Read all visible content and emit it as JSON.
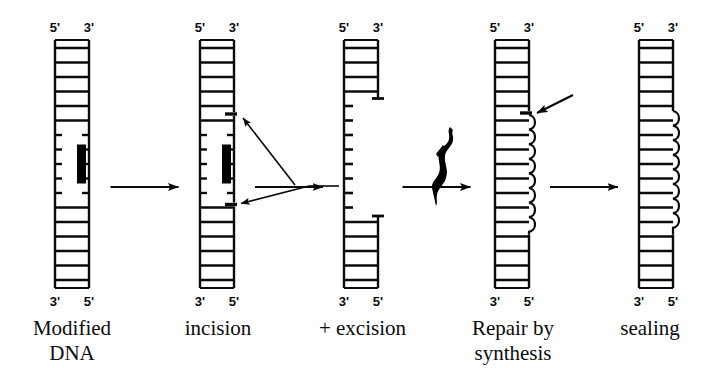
{
  "figure": {
    "ink_color": "#0b0b0b",
    "background": "#ffffff",
    "lesion_color": "#000000"
  },
  "stages": [
    {
      "id": "modified-dna",
      "caption": "Modified\nDNA",
      "caption_lines": [
        "Modified",
        "DNA"
      ],
      "top_left_label": "5'",
      "top_right_label": "3'",
      "bottom_left_label": "3'",
      "bottom_right_label": "5'",
      "center_x": 72,
      "feature": "lesion",
      "feature_note": "black bar lesion with broken rungs"
    },
    {
      "id": "incision",
      "caption": "incision",
      "caption_lines": [
        "incision"
      ],
      "top_left_label": "5'",
      "top_right_label": "3'",
      "bottom_left_label": "3'",
      "bottom_right_label": "5'",
      "center_x": 217,
      "feature": "incision-nicks",
      "feature_note": "two nicks flanking lesion, marked by arrows"
    },
    {
      "id": "excision",
      "caption": "+  excision",
      "caption_lines": [
        "+  excision"
      ],
      "plus_sign": "+",
      "word": "excision",
      "top_left_label": "5'",
      "top_right_label": "3'",
      "bottom_left_label": "3'",
      "bottom_right_label": "5'",
      "center_x": 361,
      "feature": "gap",
      "feature_note": "oligonucleotide removed leaving single-strand gap"
    },
    {
      "id": "repair-by-synthesis",
      "caption": "Repair by\nsynthesis",
      "caption_lines": [
        "Repair by",
        "synthesis"
      ],
      "top_left_label": "5'",
      "top_right_label": "3'",
      "bottom_left_label": "3'",
      "bottom_right_label": "5'",
      "center_x": 512,
      "feature": "resynthesis",
      "feature_note": "wavy newly synthesised strand, arrow at remaining nick"
    },
    {
      "id": "sealing",
      "caption": "sealing",
      "caption_lines": [
        "sealing"
      ],
      "top_left_label": "5'",
      "top_right_label": "3'",
      "bottom_left_label": "3'",
      "bottom_right_label": "5'",
      "center_x": 656,
      "feature": "sealed",
      "feature_note": "nick ligated, duplex restored"
    }
  ],
  "process_arrows": [
    {
      "id": "arrow-1",
      "from": "modified-dna",
      "to": "incision"
    },
    {
      "id": "arrow-2",
      "from": "incision",
      "to": "excision"
    },
    {
      "id": "arrow-3",
      "from": "excision",
      "to": "repair-by-synthesis"
    },
    {
      "id": "arrow-4",
      "from": "repair-by-synthesis",
      "to": "sealing"
    }
  ],
  "annotations": [
    {
      "id": "incision-pointer-upper",
      "type": "pointer-arrow",
      "target": "upper nick"
    },
    {
      "id": "incision-pointer-lower",
      "type": "pointer-arrow",
      "target": "lower nick"
    },
    {
      "id": "polymerase-blob",
      "type": "enzyme",
      "target": "DNA polymerase"
    },
    {
      "id": "repair-nick-pointer",
      "type": "pointer-arrow",
      "target": "remaining nick"
    }
  ]
}
